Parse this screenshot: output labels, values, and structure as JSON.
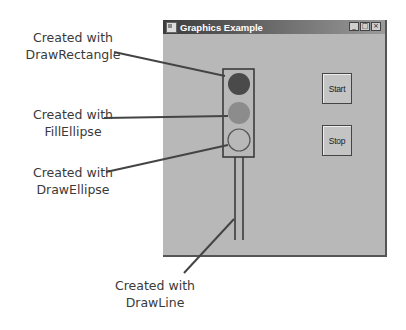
{
  "window": {
    "title": "Graphics Example",
    "controls": {
      "minimize": "_",
      "maximize": "□",
      "close": "×"
    }
  },
  "buttons": {
    "start": "Start",
    "stop": "Stop"
  },
  "traffic_light": {
    "frame_color": "#333333",
    "top_circle_color": "#4a4a4a",
    "middle_circle_color": "#8c8c8c",
    "bottom_circle_color": "none"
  },
  "callouts": [
    {
      "line1": "Created with",
      "line2": "DrawRectangle"
    },
    {
      "line1": "Created with",
      "line2": "FillEllipse"
    },
    {
      "line1": "Created with",
      "line2": "DrawEllipse"
    },
    {
      "line1": "Created with",
      "line2": "DrawLine"
    }
  ]
}
